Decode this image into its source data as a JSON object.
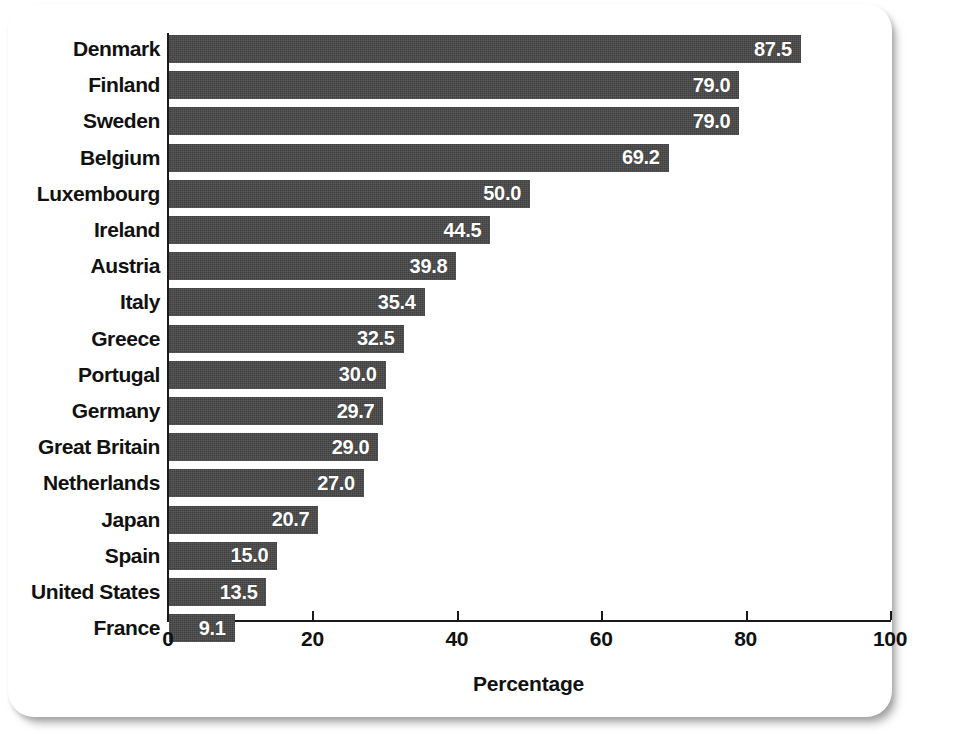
{
  "chart_data": {
    "type": "bar",
    "orientation": "horizontal",
    "title": "",
    "xlabel": "Percentage",
    "ylabel": "",
    "xlim": [
      0,
      100
    ],
    "xticks": [
      0,
      20,
      40,
      60,
      80,
      100
    ],
    "xtick_labels": [
      "0",
      "20",
      "40",
      "60",
      "80",
      "100"
    ],
    "grid": false,
    "legend": null,
    "bar_color": "#464646",
    "value_label_color": "#ffffff",
    "categories": [
      "Denmark",
      "Finland",
      "Sweden",
      "Belgium",
      "Luxembourg",
      "Ireland",
      "Austria",
      "Italy",
      "Greece",
      "Portugal",
      "Germany",
      "Great Britain",
      "Netherlands",
      "Japan",
      "Spain",
      "United States",
      "France"
    ],
    "values": [
      87.5,
      79.0,
      79.0,
      69.2,
      50.0,
      44.5,
      39.8,
      35.4,
      32.5,
      30.0,
      29.7,
      29.0,
      27.0,
      20.7,
      15.0,
      13.5,
      9.1
    ],
    "value_labels": [
      "87.5",
      "79.0",
      "79.0",
      "69.2",
      "50.0",
      "44.5",
      "39.8",
      "35.4",
      "32.5",
      "30.0",
      "29.7",
      "29.0",
      "27.0",
      "20.7",
      "15.0",
      "13.5",
      "9.1"
    ]
  }
}
